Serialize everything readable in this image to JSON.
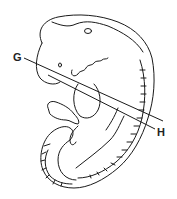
{
  "diagram": {
    "labels": {
      "g": "G",
      "h": "H"
    },
    "stroke_color": "#1a1a1a",
    "background": "#ffffff"
  }
}
